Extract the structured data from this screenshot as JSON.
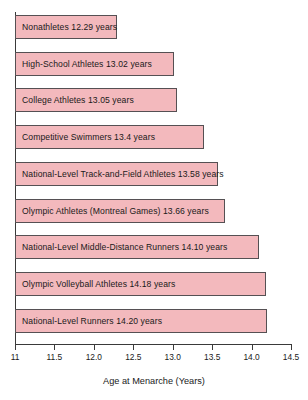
{
  "chart_data": {
    "type": "bar",
    "orientation": "horizontal",
    "title": "",
    "xlabel": "Age at Menarche (Years)",
    "ylabel": "",
    "xlim": [
      11,
      14.5
    ],
    "xticks": [
      "11",
      "11.5",
      "12.0",
      "12.5",
      "13.0",
      "13.5",
      "14.0",
      "14.5"
    ],
    "xtick_values": [
      11,
      11.5,
      12,
      12.5,
      13,
      13.5,
      14,
      14.5
    ],
    "grid": false,
    "legend": "none",
    "bar_color": "#f3b9bd",
    "bar_border_color": "#555053",
    "categories": [
      "Nonathletes",
      "High-School Athletes",
      "College Athletes",
      "Competitive Swimmers",
      "National-Level Track-and-Field Athletes",
      "Olympic Athletes (Montreal Games)",
      "National-Level Middle-Distance Runners",
      "Olympic Volleyball Athletes",
      "National-Level Runners"
    ],
    "values": [
      12.29,
      13.02,
      13.05,
      13.4,
      13.58,
      13.66,
      14.1,
      14.18,
      14.2
    ],
    "bars": [
      {
        "label": "Nonathletes 12.29 years",
        "category": "Nonathletes",
        "value": 12.29,
        "value_text": "12.29"
      },
      {
        "label": "High-School Athletes 13.02 years",
        "category": "High-School Athletes",
        "value": 13.02,
        "value_text": "13.02"
      },
      {
        "label": "College Athletes 13.05 years",
        "category": "College Athletes",
        "value": 13.05,
        "value_text": "13.05"
      },
      {
        "label": "Competitive Swimmers 13.4 years",
        "category": "Competitive Swimmers",
        "value": 13.4,
        "value_text": "13.4"
      },
      {
        "label": "National-Level Track-and-Field Athletes 13.58 years",
        "category": "National-Level Track-and-Field Athletes",
        "value": 13.58,
        "value_text": "13.58"
      },
      {
        "label": "Olympic Athletes (Montreal Games) 13.66 years",
        "category": "Olympic Athletes (Montreal Games)",
        "value": 13.66,
        "value_text": "13.66"
      },
      {
        "label": "National-Level Middle-Distance Runners 14.10 years",
        "category": "National-Level Middle-Distance Runners",
        "value": 14.1,
        "value_text": "14.10"
      },
      {
        "label": "Olympic Volleyball Athletes 14.18 years",
        "category": "Olympic Volleyball Athletes",
        "value": 14.18,
        "value_text": "14.18"
      },
      {
        "label": "National-Level Runners 14.20 years",
        "category": "National-Level Runners",
        "value": 14.2,
        "value_text": "14.20"
      }
    ]
  }
}
